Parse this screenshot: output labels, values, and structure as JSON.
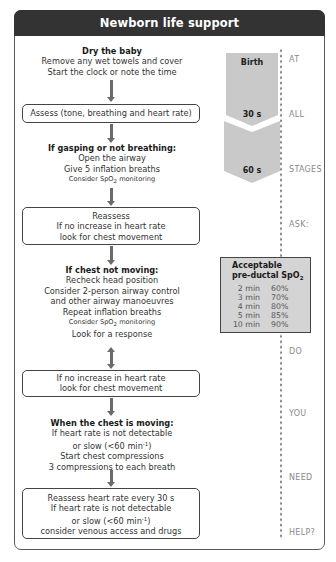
{
  "title": "Newborn life support",
  "flow": {
    "step1": {
      "heading": "Dry the baby",
      "line1": "Remove any wet towels and cover",
      "line2": "Start the clock or note the time"
    },
    "assess_box": "Assess (tone, breathing and heart rate)",
    "step2": {
      "heading": "If gasping or not breathing:",
      "line1": "Open the airway",
      "line2": "Give 5 inflation breaths",
      "small_prefix": "Consider SpO",
      "small_sub": "2",
      "small_suffix": " monitoring"
    },
    "reassess_box": {
      "line1": "Reassess",
      "line2": "If no increase in heart rate",
      "line3": "look for chest movement"
    },
    "step3": {
      "heading": "If chest not moving:",
      "line1": "Recheck head position",
      "line2": "Consider 2-person airway control",
      "line3": "and other airway manoeuvres",
      "line4": "Repeat inflation breaths",
      "small_prefix": "Consider SpO",
      "small_sub": "2",
      "small_suffix": " monitoring",
      "line5": "Look for a response"
    },
    "no_increase_box": {
      "line1": "If no increase in heart rate",
      "line2": "look for chest movement"
    },
    "step4": {
      "heading": "When the chest is moving:",
      "line1": "If heart rate is not detectable",
      "line2_prefix": "or slow (<60 min",
      "line2_sup": "-1",
      "line2_suffix": ")",
      "line3": "Start chest compressions",
      "line4": "3 compressions to each breath"
    },
    "final_box": {
      "line1": "Reassess heart rate every 30 s",
      "line2": "If heart rate is not detectable",
      "line3_prefix": "or slow (<60 min",
      "line3_sup": "-1",
      "line3_suffix": ")",
      "line4": "consider venous access and drugs"
    }
  },
  "timeline": {
    "labels": [
      "Birth",
      "30 s",
      "60 s"
    ],
    "fill_color": "#c9c9c9"
  },
  "side_labels": [
    "AT",
    "ALL",
    "STAGES",
    "ASK:",
    "DO",
    "YOU",
    "NEED",
    "HELP?"
  ],
  "spo2_table": {
    "title_line1": "Acceptable",
    "title_line2_prefix": "pre-ductal SpO",
    "title_line2_sub": "2",
    "rows": [
      {
        "time": "2 min",
        "value": "60%"
      },
      {
        "time": "3 min",
        "value": "70%"
      },
      {
        "time": "4 min",
        "value": "80%"
      },
      {
        "time": "5 min",
        "value": "85%"
      },
      {
        "time": "10 min",
        "value": "90%"
      }
    ]
  },
  "colors": {
    "header_bg": "#333333",
    "header_text": "#ffffff",
    "arrow": "#6b6b6b",
    "table_bg": "#d4d4d4",
    "side_label": "#8a8a8a"
  }
}
